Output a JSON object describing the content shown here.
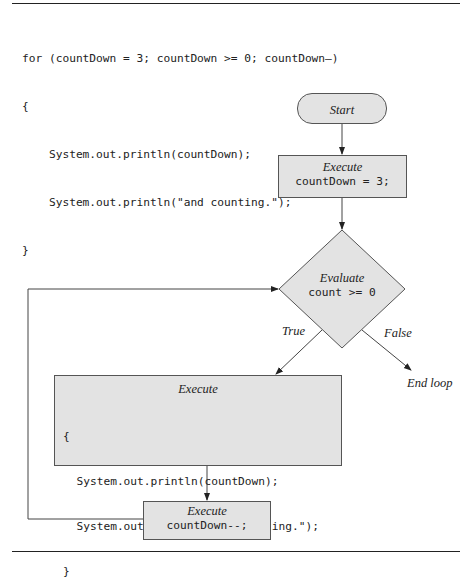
{
  "code_listing": [
    "for (countDown = 3; countDown >= 0; countDown–)",
    "{",
    "    System.out.println(countDown);",
    "    System.out.println(\"and counting.\");",
    "}"
  ],
  "flowchart": {
    "start": {
      "label": "Start"
    },
    "init": {
      "title": "Execute",
      "code": "countDown = 3;"
    },
    "condition": {
      "title": "Evaluate",
      "code": "count >= 0"
    },
    "true_label": "True",
    "false_label": "False",
    "end_label": "End loop",
    "body": {
      "title": "Execute",
      "code": [
        "{",
        "  System.out.println(countDown);",
        "  System.out.println(\"and counting.\");",
        "}"
      ]
    },
    "update": {
      "title": "Execute",
      "code": "countDown--;"
    }
  },
  "colors": {
    "shape_fill": "#e3e3e3",
    "stroke": "#444444"
  }
}
